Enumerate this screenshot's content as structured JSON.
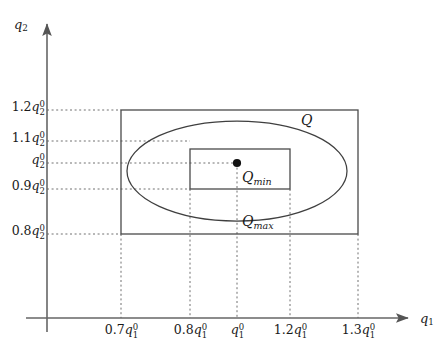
{
  "figure": {
    "axes": {
      "x_label": {
        "base": "q",
        "sub": "1"
      },
      "y_label": {
        "base": "q",
        "sub": "2"
      },
      "x_axis_y_px": 318,
      "y_axis_x_px": 47
    },
    "x_ticks": [
      {
        "coefficient": "0.7",
        "base": "q",
        "sub": "1",
        "sup": "0",
        "px": 121
      },
      {
        "coefficient": "0.8",
        "base": "q",
        "sub": "1",
        "sup": "0",
        "px": 190
      },
      {
        "coefficient": "",
        "base": "q",
        "sub": "1",
        "sup": "0",
        "px": 237
      },
      {
        "coefficient": "1.2",
        "base": "q",
        "sub": "1",
        "sup": "0",
        "px": 290
      },
      {
        "coefficient": "1.3",
        "base": "q",
        "sub": "1",
        "sup": "0",
        "px": 358
      }
    ],
    "y_ticks": [
      {
        "coefficient": "1.2",
        "base": "q",
        "sub": "2",
        "sup": "0",
        "px": 110
      },
      {
        "coefficient": "1.1",
        "base": "q",
        "sub": "2",
        "sup": "0",
        "px": 141
      },
      {
        "coefficient": "",
        "base": "q",
        "sub": "2",
        "sup": "0",
        "px": 163
      },
      {
        "coefficient": "0.9",
        "base": "q",
        "sub": "2",
        "sup": "0",
        "px": 189
      },
      {
        "coefficient": "0.8",
        "base": "q",
        "sub": "2",
        "sup": "0",
        "px": 234
      }
    ],
    "regions": {
      "outer_rect": {
        "label": {
          "base": "Q",
          "sub": "max"
        },
        "x1_px": 121,
        "y1_px": 110,
        "x2_px": 358,
        "y2_px": 234,
        "label_x_px": 243,
        "label_y_px": 222
      },
      "ellipse": {
        "label": {
          "base": "Q",
          "sub": ""
        },
        "cx_px": 237,
        "cy_px": 171,
        "rx_px": 110,
        "ry_px": 50,
        "label_x_px": 303,
        "label_y_px": 120
      },
      "inner_rect": {
        "label": {
          "base": "Q",
          "sub": "min"
        },
        "x1_px": 190,
        "y1_px": 149,
        "x2_px": 290,
        "y2_px": 189,
        "label_x_px": 243,
        "label_y_px": 178
      }
    },
    "nominal_point": {
      "name": "nominal-operating-point",
      "x_px": 237,
      "y_px": 163
    },
    "colors": {
      "stroke": "#4a4a4a",
      "guide": "#6e6e6e",
      "text": "#1a1a1a",
      "background": "#ffffff"
    }
  }
}
